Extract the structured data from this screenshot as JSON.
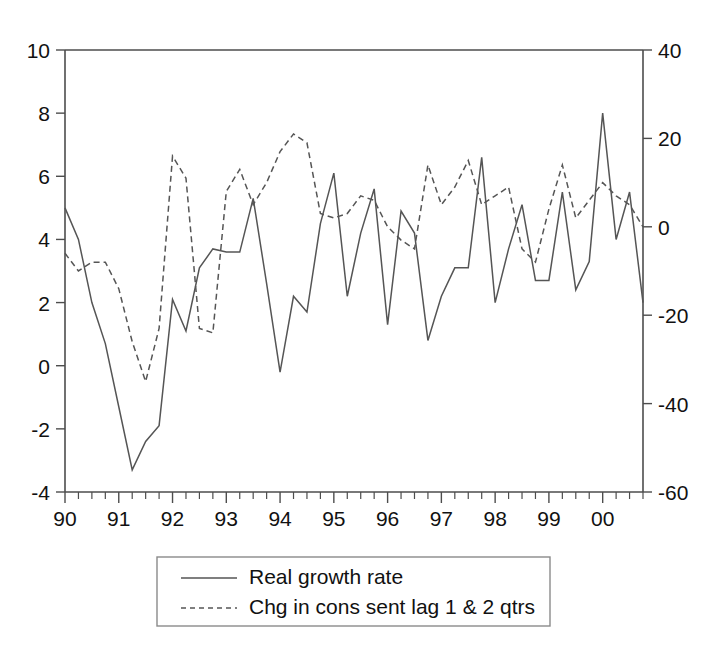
{
  "chart_data": {
    "type": "line",
    "title": "",
    "subtitle": "",
    "xlabel": "",
    "ylabel": "",
    "y2label": "",
    "grid": false,
    "legend_position": "bottom",
    "x_axis": {
      "tick_labels": [
        "90",
        "91",
        "92",
        "93",
        "94",
        "95",
        "96",
        "97",
        "98",
        "99",
        "00"
      ],
      "minor_ticks_per_label": 4,
      "note": "quarterly observations; year label at each Q1"
    },
    "y_left": {
      "ticks": [
        -4,
        -2,
        0,
        2,
        4,
        6,
        8,
        10
      ],
      "tick_labels": [
        "-4",
        "-2",
        "0",
        "2",
        "4",
        "6",
        "8",
        "10"
      ],
      "lim": [
        -4,
        10
      ]
    },
    "y_right": {
      "ticks": [
        -60,
        -40,
        -20,
        0,
        20,
        40
      ],
      "tick_labels": [
        "-60",
        "-40",
        "-20",
        "0",
        "20",
        "40"
      ],
      "lim": [
        -60,
        40
      ]
    },
    "x": [
      "90Q1",
      "90Q2",
      "90Q3",
      "90Q4",
      "91Q1",
      "91Q2",
      "91Q3",
      "91Q4",
      "92Q1",
      "92Q2",
      "92Q3",
      "92Q4",
      "93Q1",
      "93Q2",
      "93Q3",
      "93Q4",
      "94Q1",
      "94Q2",
      "94Q3",
      "94Q4",
      "95Q1",
      "95Q2",
      "95Q3",
      "95Q4",
      "96Q1",
      "96Q2",
      "96Q3",
      "96Q4",
      "97Q1",
      "97Q2",
      "97Q3",
      "97Q4",
      "98Q1",
      "98Q2",
      "98Q3",
      "98Q4",
      "99Q1",
      "99Q2",
      "99Q3",
      "99Q4",
      "00Q1",
      "00Q2",
      "00Q3",
      "00Q4"
    ],
    "series": [
      {
        "name": "Real growth rate",
        "style": "solid",
        "axis": "left",
        "color": "#555555",
        "values": [
          5.0,
          4.0,
          2.0,
          0.7,
          -1.3,
          -3.3,
          -2.4,
          -1.9,
          2.1,
          1.1,
          3.1,
          3.7,
          3.6,
          3.6,
          5.3,
          2.6,
          -0.2,
          2.2,
          1.7,
          4.5,
          6.1,
          2.2,
          4.2,
          5.6,
          1.3,
          4.9,
          4.2,
          0.8,
          2.2,
          3.1,
          3.1,
          6.6,
          2.0,
          3.7,
          5.1,
          2.7,
          2.7,
          5.5,
          2.4,
          3.3,
          8.0,
          4.0,
          5.5,
          2.0
        ],
        "note": "left-axis percent growth"
      },
      {
        "name": "Chg in cons sent lag 1 & 2 qtrs",
        "style": "dashed",
        "axis": "right",
        "color": "#555555",
        "values": [
          -6,
          -10,
          -8,
          -8,
          -14,
          -26,
          -35,
          -23,
          16,
          11,
          -23,
          -24,
          8,
          13,
          5,
          10,
          17,
          21,
          19,
          3,
          2,
          3,
          7,
          6,
          0,
          -3,
          -5,
          14,
          5,
          9,
          15,
          5,
          7,
          9,
          -5,
          -8,
          4,
          14,
          2,
          6,
          10,
          7,
          5,
          0
        ],
        "note": "right-axis index change"
      }
    ],
    "legend": {
      "entries": [
        {
          "label": "Real growth rate",
          "style": "solid"
        },
        {
          "label": "Chg in cons sent lag 1 & 2 qtrs",
          "style": "dashed"
        }
      ]
    }
  },
  "colors": {
    "line": "#555555",
    "axis": "#4d4d4d",
    "text": "#111111",
    "background": "#ffffff",
    "legend_border": "#8a8a8a"
  }
}
